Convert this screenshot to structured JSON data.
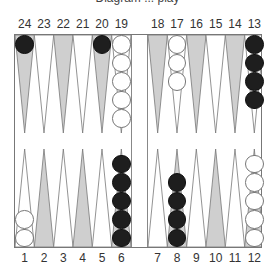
{
  "caption": "Diagram ... play",
  "labels": {
    "top": [
      "24",
      "23",
      "22",
      "21",
      "20",
      "19",
      "18",
      "17",
      "16",
      "15",
      "14",
      "13"
    ],
    "bottom": [
      "1",
      "2",
      "3",
      "4",
      "5",
      "6",
      "7",
      "8",
      "9",
      "10",
      "11",
      "12"
    ]
  },
  "colors": {
    "shaded_point": "#cfcfcf",
    "plain_point": "#ffffff",
    "black_checker": "#1e1e1e",
    "white_checker": "#ffffff"
  },
  "points": [
    {
      "point": 24,
      "color": "black",
      "count": 1
    },
    {
      "point": 20,
      "color": "black",
      "count": 1
    },
    {
      "point": 19,
      "color": "white",
      "count": 5
    },
    {
      "point": 17,
      "color": "white",
      "count": 3
    },
    {
      "point": 13,
      "color": "black",
      "count": 4
    },
    {
      "point": 1,
      "color": "white",
      "count": 2
    },
    {
      "point": 6,
      "color": "black",
      "count": 5
    },
    {
      "point": 8,
      "color": "black",
      "count": 4
    },
    {
      "point": 12,
      "color": "white",
      "count": 5
    }
  ]
}
